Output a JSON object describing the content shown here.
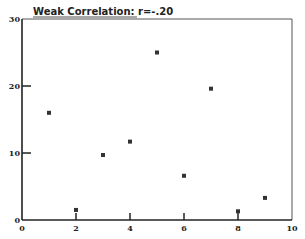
{
  "chart_data": {
    "type": "scatter",
    "title": "Weak Correlation: r=-.20",
    "xlabel": "",
    "ylabel": "",
    "xlim": [
      0,
      10
    ],
    "ylim": [
      0,
      30
    ],
    "x_ticks": [
      0,
      2,
      4,
      6,
      8,
      10
    ],
    "y_ticks": [
      0,
      10,
      20,
      30
    ],
    "grid": false,
    "legend": null,
    "points": [
      {
        "x": 1,
        "y": 16
      },
      {
        "x": 2,
        "y": 1.5
      },
      {
        "x": 3,
        "y": 9.7
      },
      {
        "x": 4,
        "y": 11.7
      },
      {
        "x": 5,
        "y": 25
      },
      {
        "x": 6,
        "y": 6.6
      },
      {
        "x": 7,
        "y": 19.6
      },
      {
        "x": 8,
        "y": 1.3
      },
      {
        "x": 9,
        "y": 3.3
      }
    ],
    "colors": {
      "axis": "#222222",
      "marker": "#333333",
      "background": "#ffffff"
    }
  }
}
